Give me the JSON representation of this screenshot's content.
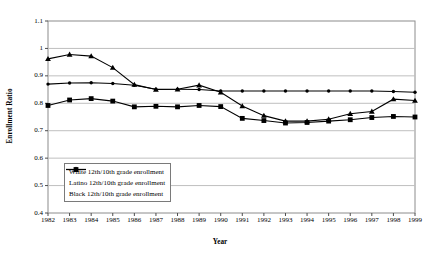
{
  "chart_data": {
    "type": "line",
    "title": "",
    "xlabel": "Year",
    "ylabel": "Enrollment Ratio",
    "grid": true,
    "legend_position": "inside-bottom-left",
    "x": [
      1982,
      1983,
      1984,
      1985,
      1986,
      1987,
      1988,
      1989,
      1990,
      1991,
      1992,
      1993,
      1994,
      1995,
      1996,
      1997,
      1998,
      1999
    ],
    "categories": [
      "1982",
      "1983",
      "1984",
      "1985",
      "1986",
      "1987",
      "1988",
      "1989",
      "1990",
      "1991",
      "1992",
      "1993",
      "1994",
      "1995",
      "1996",
      "1997",
      "1998",
      "1999"
    ],
    "xlim": [
      1982,
      1999
    ],
    "ylim": [
      0.4,
      1.1
    ],
    "yticks": [
      "1.1",
      "1",
      "0.9",
      "0.8",
      "0.7",
      "0.6",
      "0.5",
      "0.4"
    ],
    "ytick_values": [
      1.1,
      1.0,
      0.9,
      0.8,
      0.7,
      0.6,
      0.5,
      0.4
    ],
    "series": [
      {
        "name": "White 12th/10th grade enrollment",
        "marker": "dot",
        "color": "#000000",
        "values": [
          0.87,
          0.874,
          0.875,
          0.872,
          0.866,
          0.851,
          0.851,
          0.85,
          0.845,
          0.845,
          0.845,
          0.845,
          0.845,
          0.845,
          0.845,
          0.845,
          0.843,
          0.84
        ]
      },
      {
        "name": "Latino 12th/10th grade enrollment",
        "marker": "square",
        "color": "#000000",
        "values": [
          0.792,
          0.812,
          0.817,
          0.808,
          0.787,
          0.789,
          0.787,
          0.792,
          0.788,
          0.745,
          0.737,
          0.728,
          0.73,
          0.735,
          0.74,
          0.748,
          0.752,
          0.75
        ]
      },
      {
        "name": "Black 12th/10th grade enrollment",
        "marker": "triangle",
        "color": "#000000",
        "values": [
          0.962,
          0.978,
          0.972,
          0.93,
          0.868,
          0.85,
          0.851,
          0.866,
          0.84,
          0.79,
          0.755,
          0.735,
          0.735,
          0.742,
          0.762,
          0.77,
          0.815,
          0.81
        ]
      }
    ]
  },
  "legend": {
    "items": [
      {
        "label": "White 12th/10th grade enrollment",
        "marker": "dot"
      },
      {
        "label": "Latino 12th/10th grade enrollment",
        "marker": "square"
      },
      {
        "label": "Black 12th/10th grade enrollment",
        "marker": "triangle"
      }
    ]
  }
}
